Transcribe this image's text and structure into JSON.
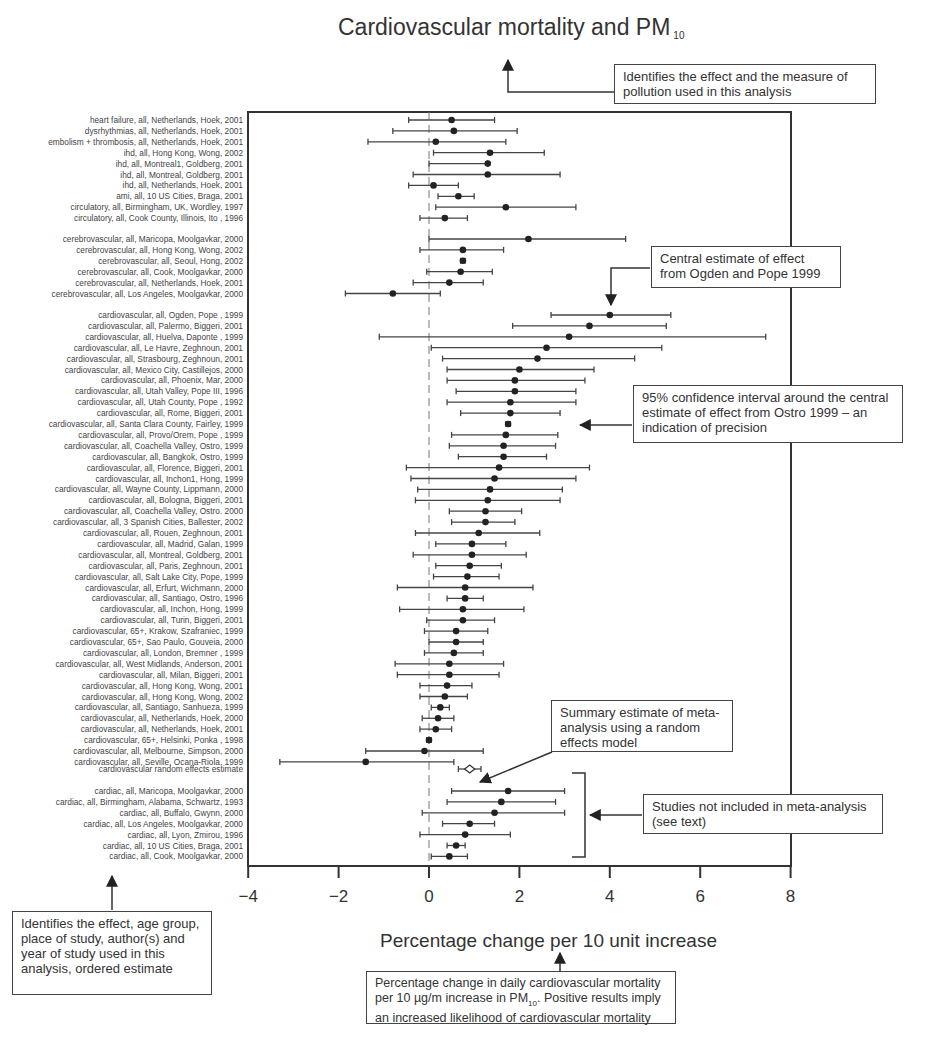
{
  "title": {
    "text": "Cardiovascular mortality and PM",
    "subscript": "10"
  },
  "xlabel": "Percentage change per 10 unit increase",
  "annotations": {
    "title_note": "Identifies the effect and the measure of pollution used in this analysis",
    "central_estimate": "Central estimate of effect from Ogden and Pope 1999",
    "confidence_interval": "95% confidence interval around the central estimate of effect from Ostro 1999 – an indication of precision",
    "summary_estimate": "Summary estimate of meta-analysis using a random effects model",
    "not_included": "Studies not included in meta-analysis (see text)",
    "labels_note": "Identifies the effect, age group, place of study, author(s) and year of study used in this analysis, ordered estimate",
    "xaxis_note_part1": "Percentage change in daily cardiovascular mortality per 10 µg/m increase in PM",
    "xaxis_note_sub": "10",
    "xaxis_note_part2": ". Positive results imply an increased likelihood of cardiovascular mortality"
  },
  "chart_data": {
    "type": "forest",
    "title": "Cardiovascular mortality and PM10",
    "xlabel": "Percentage change per 10 unit increase",
    "ylabel": "",
    "xlim": [
      -4,
      8
    ],
    "xticks": [
      -4,
      -2,
      0,
      2,
      4,
      6,
      8
    ],
    "reference_line": 0,
    "groups": [
      {
        "name": "other cardiovascular endpoints",
        "studies": [
          {
            "label": "heart failure, all, Netherlands, Hoek, 2001",
            "est": 0.5,
            "lo": -0.45,
            "hi": 1.45
          },
          {
            "label": "dysrhythmias, all, Netherlands, Hoek, 2001",
            "est": 0.55,
            "lo": -0.8,
            "hi": 1.95
          },
          {
            "label": "embolism + thrombosis, all, Netherlands, Hoek, 2001",
            "est": 0.15,
            "lo": -1.35,
            "hi": 1.7
          },
          {
            "label": "ihd, all, Hong Kong, Wong, 2002",
            "est": 1.35,
            "lo": 0.1,
            "hi": 2.55
          },
          {
            "label": "ihd, all, Montreal1, Goldberg, 2001",
            "est": 1.3,
            "lo": 0.0,
            "hi": 1.3
          },
          {
            "label": "ihd, all, Montreal, Goldberg, 2001",
            "est": 1.3,
            "lo": -0.35,
            "hi": 2.9
          },
          {
            "label": "ihd, all, Netherlands, Hoek, 2001",
            "est": 0.1,
            "lo": -0.45,
            "hi": 0.65
          },
          {
            "label": "ami, all, 10 US Cities, Braga, 2001",
            "est": 0.65,
            "lo": 0.2,
            "hi": 1.0
          },
          {
            "label": "circulatory, all, Birmingham, UK, Wordley, 1997",
            "est": 1.7,
            "lo": 0.15,
            "hi": 3.25
          },
          {
            "label": "circulatory, all, Cook County, Illinois, Ito , 1996",
            "est": 0.35,
            "lo": -0.2,
            "hi": 0.85
          }
        ]
      },
      {
        "name": "cerebrovascular",
        "studies": [
          {
            "label": "cerebrovascular, all, Maricopa, Moolgavkar, 2000",
            "est": 2.2,
            "lo": 0.0,
            "hi": 4.35
          },
          {
            "label": "cerebrovascular, all, Hong Kong, Wong, 2002",
            "est": 0.75,
            "lo": -0.2,
            "hi": 1.65
          },
          {
            "label": "cerebrovascular, all, Seoul, Hong, 2002",
            "est": 0.75,
            "lo": 0.7,
            "hi": 0.8
          },
          {
            "label": "cerebrovascular, all, Cook, Moolgavkar, 2000",
            "est": 0.7,
            "lo": -0.05,
            "hi": 1.4
          },
          {
            "label": "cerebrovascular, all, Netherlands, Hoek, 2001",
            "est": 0.45,
            "lo": -0.35,
            "hi": 1.2
          },
          {
            "label": "cerebrovascular, all, Los Angeles, Moolgavkar, 2000",
            "est": -0.8,
            "lo": -1.85,
            "hi": 0.25
          }
        ]
      },
      {
        "name": "cardiovascular",
        "studies": [
          {
            "label": "cardiovascular, all, Ogden, Pope , 1999",
            "est": 4.0,
            "lo": 2.7,
            "hi": 5.35
          },
          {
            "label": "cardiovascular, all, Palermo, Biggeri, 2001",
            "est": 3.55,
            "lo": 1.85,
            "hi": 5.25
          },
          {
            "label": "cardiovascular, all, Huelva, Daponte , 1999",
            "est": 3.1,
            "lo": -1.1,
            "hi": 7.45
          },
          {
            "label": "cardiovascular, all, Le Havre, Zeghnoun, 2001",
            "est": 2.6,
            "lo": 0.05,
            "hi": 5.15
          },
          {
            "label": "cardiovascular, all, Strasbourg, Zeghnoun, 2001",
            "est": 2.4,
            "lo": 0.3,
            "hi": 4.55
          },
          {
            "label": "cardiovascular, all, Mexico City, Castillejos, 2000",
            "est": 2.0,
            "lo": 0.4,
            "hi": 3.65
          },
          {
            "label": "cardiovascular, all, Phoenix, Mar, 2000",
            "est": 1.9,
            "lo": 0.4,
            "hi": 3.45
          },
          {
            "label": "cardiovascular, all, Utah Valley, Pope III, 1996",
            "est": 1.9,
            "lo": 0.6,
            "hi": 3.25
          },
          {
            "label": "cardiovascular, all, Utah County, Pope , 1992",
            "est": 1.8,
            "lo": 0.4,
            "hi": 3.25
          },
          {
            "label": "cardiovascular, all, Rome, Biggeri, 2001",
            "est": 1.8,
            "lo": 0.7,
            "hi": 2.9
          },
          {
            "label": "cardiovascular, all, Santa Clara County,  Fairley, 1999",
            "est": 1.75,
            "lo": 1.7,
            "hi": 1.8
          },
          {
            "label": "cardiovascular, all, Provo/Orem, Pope , 1999",
            "est": 1.7,
            "lo": 0.5,
            "hi": 2.85
          },
          {
            "label": "cardiovascular, all, Coachella Valley, Ostro, 1999",
            "est": 1.65,
            "lo": 0.45,
            "hi": 2.8
          },
          {
            "label": "cardiovascular, all, Bangkok, Ostro, 1999",
            "est": 1.65,
            "lo": 0.65,
            "hi": 2.6
          },
          {
            "label": "cardiovascular, all, Florence, Biggeri, 2001",
            "est": 1.55,
            "lo": -0.5,
            "hi": 3.55
          },
          {
            "label": "cardiovascular, all, Inchon1, Hong, 1999",
            "est": 1.45,
            "lo": -0.4,
            "hi": 3.25
          },
          {
            "label": "cardiovascular, all, Wayne County, Lippmann, 2000",
            "est": 1.35,
            "lo": -0.25,
            "hi": 2.95
          },
          {
            "label": "cardiovascular, all, Bologna, Biggeri, 2001",
            "est": 1.3,
            "lo": -0.3,
            "hi": 2.9
          },
          {
            "label": "cardiovascular, all, Coachella Valley, Ostro. 2000",
            "est": 1.25,
            "lo": 0.45,
            "hi": 2.05
          },
          {
            "label": "cardiovascular, all, 3 Spanish Cities, Ballester, 2002",
            "est": 1.25,
            "lo": 0.5,
            "hi": 1.9
          },
          {
            "label": "cardiovascular, all, Rouen, Zeghnoun, 2001",
            "est": 1.1,
            "lo": -0.3,
            "hi": 2.45
          },
          {
            "label": "cardiovascular, all, Madrid, Galan, 1999",
            "est": 0.95,
            "lo": 0.15,
            "hi": 1.7
          },
          {
            "label": "cardiovascular, all, Montreal, Goldberg, 2001",
            "est": 0.95,
            "lo": -0.35,
            "hi": 2.15
          },
          {
            "label": "cardiovascular, all, Paris, Zeghnoun, 2001",
            "est": 0.9,
            "lo": 0.15,
            "hi": 1.6
          },
          {
            "label": "cardiovascular, all, Salt Lake City, Pope, 1999",
            "est": 0.85,
            "lo": 0.1,
            "hi": 1.55
          },
          {
            "label": "cardiovascular, all, Erfurt, Wichmann, 2000",
            "est": 0.8,
            "lo": -0.7,
            "hi": 2.3
          },
          {
            "label": "cardiovascular, all, Santiago, Ostro, 1996",
            "est": 0.8,
            "lo": 0.4,
            "hi": 1.2
          },
          {
            "label": "cardiovascular, all, Inchon, Hong, 1999",
            "est": 0.75,
            "lo": -0.65,
            "hi": 2.1
          },
          {
            "label": "cardiovascular, all, Turin, Biggeri, 2001",
            "est": 0.75,
            "lo": -0.05,
            "hi": 1.45
          },
          {
            "label": "cardiovascular, 65+, Krakow, Szafraniec, 1999",
            "est": 0.6,
            "lo": -0.1,
            "hi": 1.3
          },
          {
            "label": "cardiovascular, 65+, Sao Paulo, Gouveia, 2000",
            "est": 0.6,
            "lo": 0.0,
            "hi": 1.2
          },
          {
            "label": "cardiovascular, all, London, Bremner , 1999",
            "est": 0.55,
            "lo": -0.1,
            "hi": 1.2
          },
          {
            "label": "cardiovascular, all, West Midlands, Anderson, 2001",
            "est": 0.45,
            "lo": -0.75,
            "hi": 1.65
          },
          {
            "label": "cardiovascular, all, Milan, Biggeri, 2001",
            "est": 0.45,
            "lo": -0.7,
            "hi": 1.55
          },
          {
            "label": "cardiovascular, all, Hong Kong, Wong, 2001",
            "est": 0.4,
            "lo": -0.2,
            "hi": 0.95
          },
          {
            "label": "cardiovascular, all, Hong Kong, Wong, 2002",
            "est": 0.35,
            "lo": -0.2,
            "hi": 0.85
          },
          {
            "label": "cardiovascular, all, Santiago, Sanhueza, 1999",
            "est": 0.25,
            "lo": 0.05,
            "hi": 0.45
          },
          {
            "label": "cardiovascular, all, Netherlands, Hoek, 2000",
            "est": 0.2,
            "lo": -0.15,
            "hi": 0.55
          },
          {
            "label": "cardiovascular, all, Netherlands, Hoek, 2001",
            "est": 0.15,
            "lo": -0.2,
            "hi": 0.5
          },
          {
            "label": "cardiovascular, 65+, Helsinki, Ponka , 1998",
            "est": 0.0,
            "lo": -0.05,
            "hi": 0.05
          },
          {
            "label": "cardiovascular, all, Melbourne, Simpson, 2000",
            "est": -0.1,
            "lo": -1.4,
            "hi": 1.2
          },
          {
            "label": "cardiovascular, all, Seville, Ocana-Riola, 1999",
            "est": -1.4,
            "lo": -3.3,
            "hi": 0.55
          }
        ]
      },
      {
        "name": "summary",
        "studies": [
          {
            "label": "cardiovascular random effects estimate",
            "est": 0.9,
            "lo": 0.65,
            "hi": 1.15,
            "marker": "diamond"
          }
        ]
      },
      {
        "name": "cardiac (not included in meta-analysis)",
        "studies": [
          {
            "label": "cardiac, all, Maricopa, Moolgavkar, 2000",
            "est": 1.75,
            "lo": 0.5,
            "hi": 3.0
          },
          {
            "label": "cardiac, all, Birmingham, Alabama, Schwartz, 1993",
            "est": 1.6,
            "lo": 0.4,
            "hi": 2.8
          },
          {
            "label": "cardiac, all, Buffalo, Gwynn, 2000",
            "est": 1.45,
            "lo": -0.15,
            "hi": 3.0
          },
          {
            "label": "cardiac, all, Los Angeles, Moolgavkar, 2000",
            "est": 0.9,
            "lo": 0.3,
            "hi": 1.45
          },
          {
            "label": "cardiac, all, Lyon, Zmirou, 1996",
            "est": 0.8,
            "lo": -0.2,
            "hi": 1.8
          },
          {
            "label": "cardiac, all, 10 US Cities, Braga, 2001",
            "est": 0.6,
            "lo": 0.4,
            "hi": 0.8
          },
          {
            "label": "cardiac, all, Cook, Moolgavkar, 2000",
            "est": 0.45,
            "lo": 0.05,
            "hi": 0.85
          }
        ]
      }
    ],
    "legend": null,
    "grid": false
  }
}
